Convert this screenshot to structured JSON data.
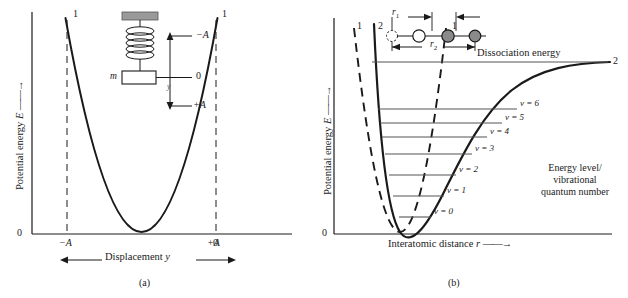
{
  "figure": {
    "type": "physics-potential-energy-diagram",
    "panels": [
      {
        "id": "a",
        "caption": "(a)",
        "ylabel": "Potential energy",
        "ylabel_symbol": "E",
        "xlabel": "Displacement",
        "xlabel_symbol": "y",
        "y_origin_label": "0",
        "xticks": [
          "−A",
          "0",
          "+A"
        ],
        "curve_labels": [
          "1",
          "1"
        ],
        "inset": {
          "name": "spring-mass-oscillator",
          "mass_label": "m",
          "displacement_symbol": "y",
          "marks": [
            "−A",
            "0",
            "+A"
          ],
          "support_color": "#9a9a9a"
        }
      },
      {
        "id": "b",
        "caption": "(b)",
        "ylabel": "Potential energy",
        "ylabel_symbol": "E",
        "xlabel": "Interatomic distance",
        "xlabel_symbol": "r",
        "y_origin_label": "0",
        "curve_labels": {
          "harmonic_left": "1",
          "anharmonic_left": "2",
          "harmonic_right": "1",
          "anharmonic_right": "2"
        },
        "dissociation_label": "Dissociation energy",
        "annotation": [
          "Energy level/",
          "vibrational",
          "quantum number"
        ],
        "levels": [
          {
            "label": "v = 0"
          },
          {
            "label": "v = 1"
          },
          {
            "label": "v = 2"
          },
          {
            "label": "v = 3"
          },
          {
            "label": "v = 4"
          },
          {
            "label": "v = 5"
          },
          {
            "label": "v = 6"
          }
        ],
        "inset": {
          "name": "diatomic-molecule-vibration",
          "r1_label": "r",
          "r1_sub": "1",
          "r2_label": "r",
          "r2_sub": "2",
          "atom_fill": "#8a8a8a"
        }
      }
    ],
    "colors": {
      "ink": "#1a1a1a",
      "level_line": "#555555",
      "gray_fill": "#8a8a8a"
    }
  }
}
